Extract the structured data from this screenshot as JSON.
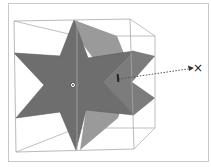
{
  "viewport": {
    "frame_color": "#c8c8c8",
    "background": "#ffffff"
  },
  "scene": {
    "object": "six-pointed star extrusion",
    "bounding_box_color": "#a8a8a8",
    "star_face_color": "#6e6e6e",
    "extrude_side_color": "#9a9a9a",
    "extrude_side_right_color": "#7c7c7c",
    "pivot_icon": "pivot-crosshair-icon",
    "handle_icon": "gizmo-handle-icon"
  },
  "annotation": {
    "arrow_style": "dotted",
    "arrow_color": "#555555",
    "target_label": "×"
  }
}
